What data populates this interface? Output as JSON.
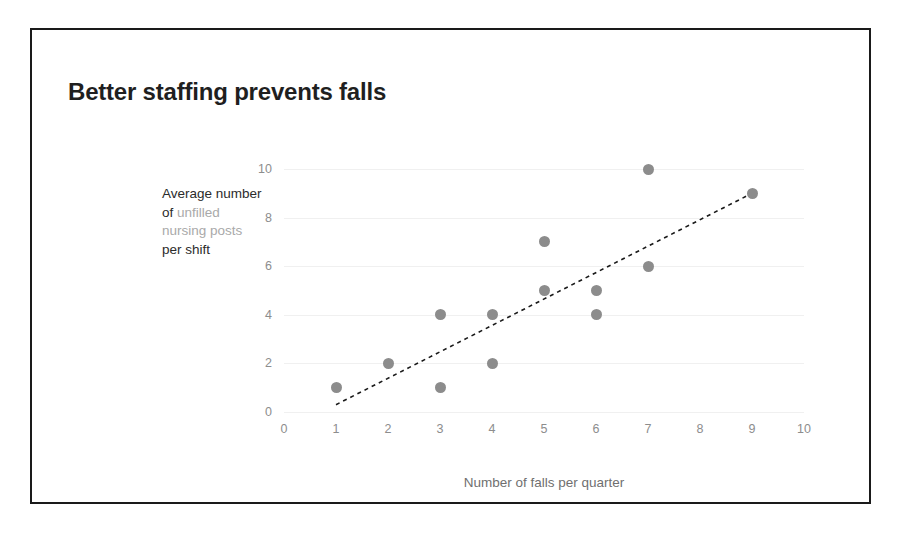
{
  "slide": {
    "title": "Better staffing prevents falls",
    "border_color": "#1a1a1a",
    "background": "#ffffff"
  },
  "y_axis_caption": {
    "line1": "Average number",
    "line2_prefix": "of ",
    "line2_highlight": "unfilled",
    "line3_highlight": "nursing posts",
    "line4": "per shift",
    "highlight_color": "#a9a9a9",
    "text_color": "#2b2b2b"
  },
  "chart_data": {
    "type": "scatter",
    "title": "Better staffing prevents falls",
    "xlabel": "Number of falls per quarter",
    "ylabel": "Average number of unfilled nursing posts per shift",
    "xlim": [
      0,
      10
    ],
    "ylim": [
      0,
      10
    ],
    "xticks": [
      0,
      1,
      2,
      3,
      4,
      5,
      6,
      7,
      8,
      9,
      10
    ],
    "yticks": [
      0,
      2,
      4,
      6,
      8,
      10
    ],
    "grid": "horizontal",
    "legend": "none",
    "point_color": "#8c8c8c",
    "points": [
      {
        "x": 1,
        "y": 1
      },
      {
        "x": 2,
        "y": 2
      },
      {
        "x": 3,
        "y": 1
      },
      {
        "x": 3,
        "y": 4
      },
      {
        "x": 4,
        "y": 2
      },
      {
        "x": 4,
        "y": 4
      },
      {
        "x": 5,
        "y": 5
      },
      {
        "x": 5,
        "y": 7
      },
      {
        "x": 6,
        "y": 4
      },
      {
        "x": 6,
        "y": 5
      },
      {
        "x": 7,
        "y": 6
      },
      {
        "x": 7,
        "y": 10
      },
      {
        "x": 9,
        "y": 9
      }
    ],
    "trendline": {
      "style": "dashed",
      "color": "#1a1a1a",
      "x_start": 1.0,
      "y_start": 0.3,
      "x_end": 9.0,
      "y_end": 9.0
    }
  }
}
